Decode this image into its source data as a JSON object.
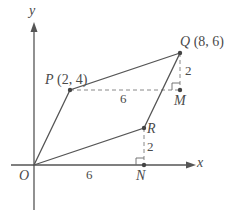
{
  "diagram": {
    "type": "coordinate-geometry-parallelogram",
    "axes": {
      "x_label": "x",
      "y_label": "y",
      "origin_label": "O"
    },
    "points": {
      "O": {
        "label": "O",
        "coords": ""
      },
      "P": {
        "label": "P",
        "coords": "(2, 4)"
      },
      "Q": {
        "label": "Q",
        "coords": "(8, 6)"
      },
      "R": {
        "label": "R",
        "coords": ""
      },
      "M": {
        "label": "M",
        "coords": ""
      },
      "N": {
        "label": "N",
        "coords": ""
      }
    },
    "measurements": {
      "PM": "6",
      "QM": "2",
      "ON": "6",
      "RN": "2"
    },
    "colors": {
      "line": "#555555",
      "dashed": "#888888",
      "text": "#4a4a4a"
    }
  }
}
